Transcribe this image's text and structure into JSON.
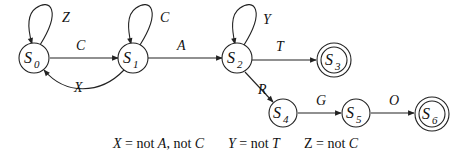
{
  "diagram": {
    "type": "finite-state-machine",
    "states": [
      {
        "id": "S0",
        "base": "S",
        "sub": "0",
        "accepting": false
      },
      {
        "id": "S1",
        "base": "S",
        "sub": "1",
        "accepting": false
      },
      {
        "id": "S2",
        "base": "S",
        "sub": "2",
        "accepting": false
      },
      {
        "id": "S3",
        "base": "S",
        "sub": "3",
        "accepting": true
      },
      {
        "id": "S4",
        "base": "S",
        "sub": "4",
        "accepting": false
      },
      {
        "id": "S5",
        "base": "S",
        "sub": "5",
        "accepting": false
      },
      {
        "id": "S6",
        "base": "S",
        "sub": "6",
        "accepting": true
      }
    ],
    "transitions": [
      {
        "from": "S0",
        "to": "S0",
        "label": "Z"
      },
      {
        "from": "S0",
        "to": "S1",
        "label": "C"
      },
      {
        "from": "S1",
        "to": "S1",
        "label": "C"
      },
      {
        "from": "S1",
        "to": "S0",
        "label": "X"
      },
      {
        "from": "S1",
        "to": "S2",
        "label": "A"
      },
      {
        "from": "S2",
        "to": "S2",
        "label": "Y"
      },
      {
        "from": "S2",
        "to": "S3",
        "label": "T"
      },
      {
        "from": "S2",
        "to": "S4",
        "label": "R"
      },
      {
        "from": "S4",
        "to": "S5",
        "label": "G"
      },
      {
        "from": "S5",
        "to": "S6",
        "label": "O"
      }
    ],
    "legend": [
      {
        "var": "X",
        "eq": " = not ",
        "a": "A",
        "sep": ", not ",
        "b": "C"
      },
      {
        "var": "Y",
        "eq": " = not ",
        "a": "T"
      },
      {
        "var": "Z",
        "eq": " = not ",
        "a": "C"
      }
    ]
  }
}
